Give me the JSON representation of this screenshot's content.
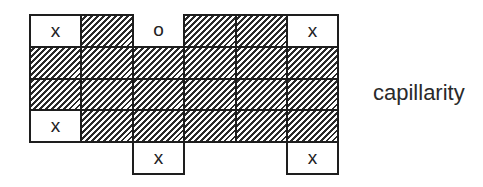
{
  "diagram": {
    "label": "capillarity",
    "grid": {
      "origin_x": 29,
      "origin_y": 14,
      "col_width": 51.4,
      "row_height": 31.8,
      "border_color": "#1e1e1e",
      "border_width": 2
    },
    "cells": [
      {
        "row": 0,
        "col": 0,
        "type": "marked",
        "text": "x"
      },
      {
        "row": 0,
        "col": 1,
        "type": "hatched",
        "text": ""
      },
      {
        "row": 0,
        "col": 2,
        "type": "open",
        "text": "o"
      },
      {
        "row": 0,
        "col": 3,
        "type": "hatched",
        "text": ""
      },
      {
        "row": 0,
        "col": 4,
        "type": "hatched",
        "text": ""
      },
      {
        "row": 0,
        "col": 5,
        "type": "marked",
        "text": "x"
      },
      {
        "row": 1,
        "col": 0,
        "type": "hatched",
        "text": ""
      },
      {
        "row": 1,
        "col": 1,
        "type": "hatched",
        "text": ""
      },
      {
        "row": 1,
        "col": 2,
        "type": "hatched",
        "text": ""
      },
      {
        "row": 1,
        "col": 3,
        "type": "hatched",
        "text": ""
      },
      {
        "row": 1,
        "col": 4,
        "type": "hatched",
        "text": ""
      },
      {
        "row": 1,
        "col": 5,
        "type": "hatched",
        "text": ""
      },
      {
        "row": 2,
        "col": 0,
        "type": "hatched",
        "text": ""
      },
      {
        "row": 2,
        "col": 1,
        "type": "hatched",
        "text": ""
      },
      {
        "row": 2,
        "col": 2,
        "type": "hatched",
        "text": ""
      },
      {
        "row": 2,
        "col": 3,
        "type": "hatched",
        "text": ""
      },
      {
        "row": 2,
        "col": 4,
        "type": "hatched",
        "text": ""
      },
      {
        "row": 2,
        "col": 5,
        "type": "hatched",
        "text": ""
      },
      {
        "row": 3,
        "col": 0,
        "type": "marked",
        "text": "x"
      },
      {
        "row": 3,
        "col": 1,
        "type": "hatched",
        "text": ""
      },
      {
        "row": 3,
        "col": 2,
        "type": "hatched",
        "text": ""
      },
      {
        "row": 3,
        "col": 3,
        "type": "hatched",
        "text": ""
      },
      {
        "row": 3,
        "col": 4,
        "type": "hatched",
        "text": ""
      },
      {
        "row": 3,
        "col": 5,
        "type": "hatched",
        "text": ""
      },
      {
        "row": 4,
        "col": 2,
        "type": "marked",
        "text": "x"
      },
      {
        "row": 4,
        "col": 5,
        "type": "marked",
        "text": "x"
      }
    ]
  }
}
